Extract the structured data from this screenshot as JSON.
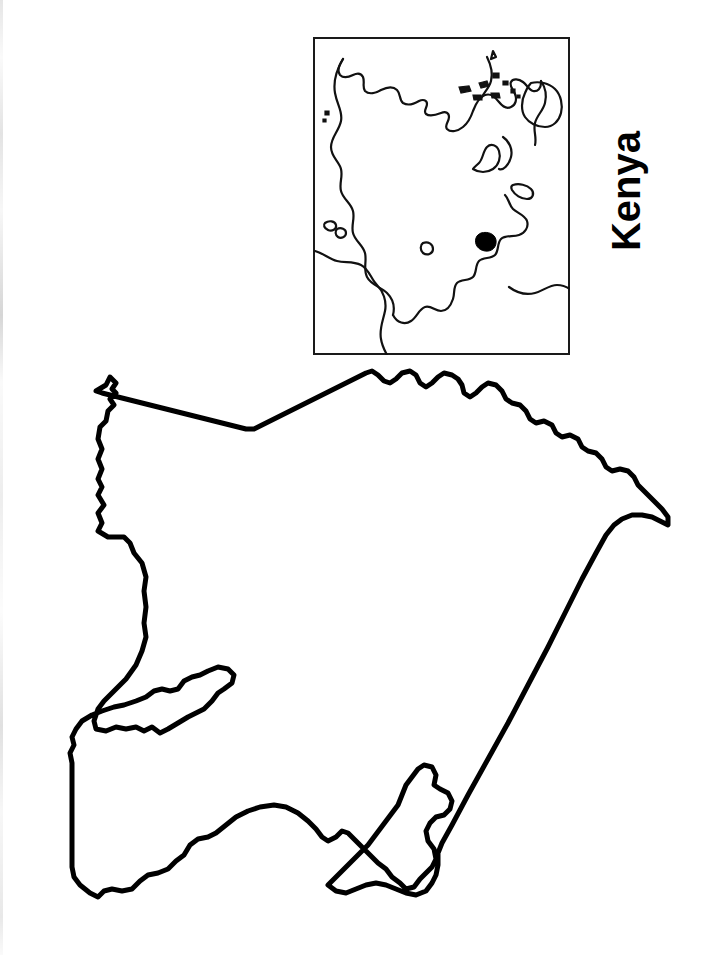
{
  "document": {
    "kind": "outline-map-worksheet",
    "title": "Kenya",
    "page_width": 716,
    "page_height": 955,
    "background_color": "#ffffff",
    "ink_color": "#000000"
  },
  "label": {
    "text": "Kenya",
    "orientation": "rotated-90-counterclockwise",
    "weight": "bold",
    "color": "#000000"
  },
  "inset": {
    "name": "world-locator-map",
    "frame_color": "#1a1a1a",
    "frame_x": 313,
    "frame_y": 37,
    "frame_width": 257,
    "frame_height": 318,
    "marker": {
      "name": "kenya-locator-dot",
      "color": "#000000",
      "x": 174,
      "y": 203
    }
  },
  "main_map": {
    "name": "kenya-outline",
    "stroke_color": "#000000",
    "fill_color": "#ffffff",
    "stroke_width": 5,
    "x": 40,
    "y": 355,
    "width": 650,
    "height": 560
  }
}
